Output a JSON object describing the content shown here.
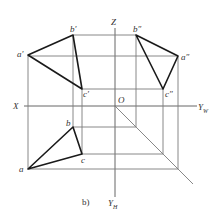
{
  "figure": {
    "caption": "b)",
    "axes": {
      "x_label": "X",
      "z_label": "Z",
      "origin_label": "O",
      "yw_label": "Y",
      "yw_sub": "W",
      "yh_label": "Y",
      "yh_sub": "H"
    },
    "front_view": {
      "a": {
        "label": "a′",
        "x": 28,
        "y": 55
      },
      "b": {
        "label": "b′",
        "x": 73,
        "y": 35
      },
      "c": {
        "label": "c′",
        "x": 82,
        "y": 89
      }
    },
    "side_view": {
      "a": {
        "label": "a″",
        "x": 178,
        "y": 56
      },
      "b": {
        "label": "b″",
        "x": 136,
        "y": 35
      },
      "c": {
        "label": "c″",
        "x": 163,
        "y": 89
      }
    },
    "top_view": {
      "a": {
        "label": "a",
        "x": 28,
        "y": 169
      },
      "b": {
        "label": "b",
        "x": 73,
        "y": 127
      },
      "c": {
        "label": "c",
        "x": 82,
        "y": 154
      }
    },
    "colors": {
      "outline": "#1a1a1a",
      "construction": "#7a7a7a",
      "text": "#333333"
    }
  }
}
